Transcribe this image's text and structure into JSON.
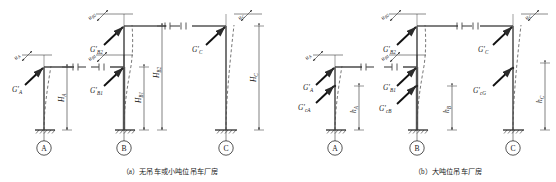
{
  "figure": {
    "panels": [
      {
        "id": "a",
        "caption": "（a）无吊车或小吨位吊车厂房",
        "columns": [
          {
            "axis_label": "A",
            "type": "uniform",
            "loads": [
              {
                "symbol": "G′",
                "subscript": "A",
                "name": "column-top-gravity-load-A"
              }
            ],
            "displacements": [
              {
                "symbol": "u",
                "subscript": "A",
                "name": "top-displacement-A"
              }
            ],
            "dimensions": [
              {
                "symbol": "H",
                "subscript": "A",
                "name": "column-height-A"
              }
            ]
          },
          {
            "axis_label": "B",
            "type": "stepped",
            "loads": [
              {
                "symbol": "G′",
                "subscript": "B2",
                "name": "upper-column-gravity-load-B"
              },
              {
                "symbol": "G′",
                "subscript": "B1",
                "name": "lower-column-gravity-load-B"
              }
            ],
            "displacements": [
              {
                "symbol": "u",
                "subscript": "B2",
                "name": "upper-displacement-B"
              },
              {
                "symbol": "u",
                "subscript": "B1",
                "name": "lower-displacement-B"
              }
            ],
            "dimensions": [
              {
                "symbol": "H",
                "subscript": "B1",
                "name": "lower-column-height-B"
              },
              {
                "symbol": "H",
                "subscript": "B2",
                "name": "total-column-height-B"
              }
            ]
          },
          {
            "axis_label": "C",
            "type": "uniform",
            "loads": [
              {
                "symbol": "G′",
                "subscript": "C",
                "name": "column-top-gravity-load-C"
              }
            ],
            "displacements": [
              {
                "symbol": "u",
                "subscript": "C",
                "name": "top-displacement-C"
              }
            ],
            "dimensions": [
              {
                "symbol": "H",
                "subscript": "C",
                "name": "column-height-C"
              }
            ]
          }
        ]
      },
      {
        "id": "b",
        "caption": "（b）大吨位吊车厂房",
        "columns": [
          {
            "axis_label": "A",
            "type": "uniform",
            "loads": [
              {
                "symbol": "G′",
                "subscript": "A",
                "name": "column-top-gravity-load-A"
              },
              {
                "symbol": "G′",
                "subscript": "cA",
                "name": "crane-gravity-load-A"
              }
            ],
            "displacements": [
              {
                "symbol": "u",
                "subscript": "A",
                "name": "top-displacement-A"
              }
            ],
            "dimensions": [
              {
                "symbol": "h",
                "subscript": "A",
                "name": "column-height-A"
              }
            ]
          },
          {
            "axis_label": "B",
            "type": "stepped",
            "loads": [
              {
                "symbol": "G′",
                "subscript": "B2",
                "name": "upper-column-gravity-load-B"
              },
              {
                "symbol": "G′",
                "subscript": "B1",
                "name": "lower-column-gravity-load-B"
              },
              {
                "symbol": "G′",
                "subscript": "cB",
                "name": "crane-gravity-load-B"
              }
            ],
            "displacements": [
              {
                "symbol": "u",
                "subscript": "B2",
                "name": "upper-displacement-B"
              },
              {
                "symbol": "u",
                "subscript": "B1",
                "name": "lower-displacement-B"
              }
            ],
            "dimensions": [
              {
                "symbol": "h",
                "subscript": "B",
                "name": "column-height-B"
              }
            ]
          },
          {
            "axis_label": "C",
            "type": "uniform",
            "loads": [
              {
                "symbol": "G′",
                "subscript": "C",
                "name": "column-top-gravity-load-C"
              },
              {
                "symbol": "G′",
                "subscript": "cG",
                "name": "crane-gravity-load-C"
              }
            ],
            "displacements": [
              {
                "symbol": "u",
                "subscript": "C",
                "name": "top-displacement-C"
              }
            ],
            "dimensions": [
              {
                "symbol": "h",
                "subscript": "C",
                "name": "column-height-C"
              }
            ]
          }
        ]
      }
    ],
    "colors": {
      "line": "#2b2b2b",
      "member": "#5a5a5a",
      "dashed": "#4a4a4a",
      "text": "#1a1a1a"
    }
  },
  "labels": {
    "panel_a": {
      "uA": "u",
      "uA_sub": "A",
      "GA": "G′",
      "GA_sub": "A",
      "HA": "H",
      "HA_sub": "A",
      "uB2": "u",
      "uB2_sub": "B2",
      "uB1": "u",
      "uB1_sub": "B1",
      "GB2": "G′",
      "GB2_sub": "B2",
      "GB1": "G′",
      "GB1_sub": "B1",
      "HB1": "H",
      "HB1_sub": "B1",
      "HB2": "H",
      "HB2_sub": "B2",
      "uC": "u",
      "uC_sub": "C",
      "GC": "G′",
      "GC_sub": "C",
      "HC": "H",
      "HC_sub": "C",
      "axisA": "A",
      "axisB": "B",
      "axisC": "C"
    },
    "panel_b": {
      "uA": "u",
      "uA_sub": "A",
      "GA": "G′",
      "GA_sub": "A",
      "GcA": "G′",
      "GcA_sub": "cA",
      "hA": "h",
      "hA_sub": "A",
      "uB2": "u",
      "uB2_sub": "B2",
      "uB1": "u",
      "uB1_sub": "B1",
      "GB2": "G′",
      "GB2_sub": "B2",
      "GB1": "G′",
      "GB1_sub": "B1",
      "GcB": "G′",
      "GcB_sub": "cB",
      "hB": "h",
      "hB_sub": "B",
      "uC": "u",
      "uC_sub": "C",
      "GC": "G′",
      "GC_sub": "C",
      "GcG": "G′",
      "GcG_sub": "cG",
      "hC": "h",
      "hC_sub": "C",
      "axisA": "A",
      "axisB": "B",
      "axisC": "C"
    }
  }
}
